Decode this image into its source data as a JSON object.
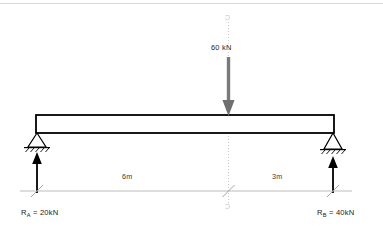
{
  "diagram": {
    "colors": {
      "beam_outline": "#000000",
      "load_arrow": "#7a7a7a",
      "reaction_arrow": "#000000",
      "centerline": "#c8c8cc",
      "dimension_line": "#b4b4b8",
      "top_rule": "#d9d9dd",
      "background": "#ffffff"
    },
    "load": {
      "label": "60 kN",
      "magnitude": 60,
      "unit": "kN",
      "direction": "down",
      "position_m": 6
    },
    "centerline": {
      "top_mark": "C",
      "bottom_mark": "C"
    },
    "dimensions": [
      {
        "label": "6m",
        "value": 6,
        "unit": "m",
        "from": "A",
        "to": "C"
      },
      {
        "label": "3m",
        "value": 3,
        "unit": "m",
        "from": "C",
        "to": "B"
      }
    ],
    "supports": [
      {
        "id": "A",
        "type": "pinned",
        "position_m": 0
      },
      {
        "id": "B",
        "type": "pinned",
        "position_m": 9
      }
    ],
    "reactions": [
      {
        "id": "A",
        "symbol": "R",
        "subscript": "A",
        "equals": " = ",
        "value": "20kN",
        "magnitude": 20,
        "unit": "kN",
        "direction": "up"
      },
      {
        "id": "B",
        "symbol": "R",
        "subscript": "B",
        "equals": " = ",
        "value": "40kN",
        "magnitude": 40,
        "unit": "kN",
        "direction": "up"
      }
    ],
    "beam": {
      "span_m": 9,
      "style": "hollow rectangle"
    }
  }
}
